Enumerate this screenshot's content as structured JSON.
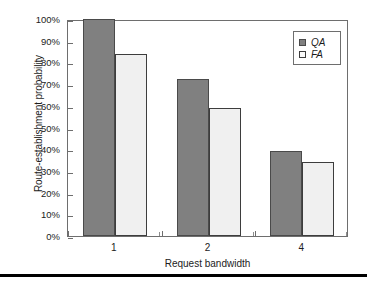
{
  "chart_data": {
    "type": "bar",
    "title": "",
    "xlabel": "Request bandwidth",
    "ylabel": "Route-establishment probability",
    "categories": [
      "1",
      "2",
      "4"
    ],
    "series": [
      {
        "name": "QA",
        "values": [
          100,
          72.5,
          39
        ],
        "color": "#808080"
      },
      {
        "name": "FA",
        "values": [
          84,
          59,
          34
        ],
        "color": "#f0f0f0"
      }
    ],
    "ylim": [
      0,
      100
    ],
    "ytick_labels": [
      "100%",
      "90%",
      "80%",
      "70%",
      "60%",
      "50%",
      "40%",
      "30%",
      "20%",
      "10%",
      "0%"
    ],
    "ytick_values": [
      100,
      90,
      80,
      70,
      60,
      50,
      40,
      30,
      20,
      10,
      0
    ],
    "grid": false,
    "legend_position": "top-right",
    "legend_entries": [
      "QA",
      "FA"
    ]
  },
  "figure": {
    "bottom_rule_color": "#000000",
    "frame_color": "#6e6e6e",
    "background": "#ffffff"
  }
}
